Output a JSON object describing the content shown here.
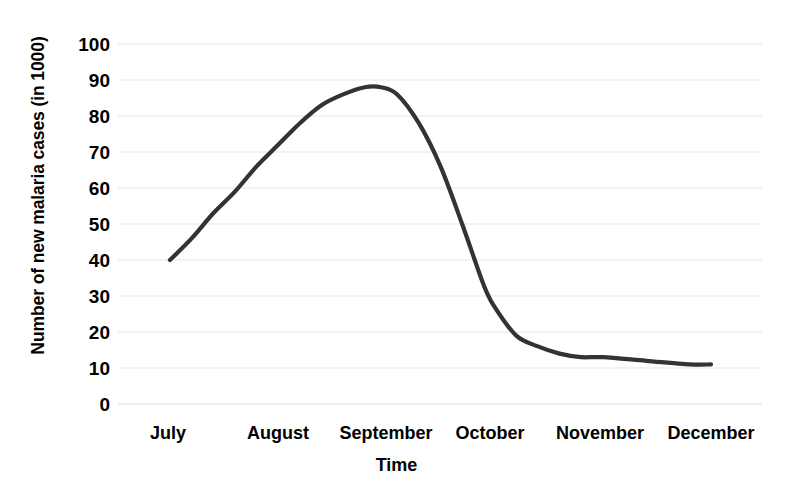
{
  "chart_data": {
    "type": "line",
    "title": "",
    "subtitle": "",
    "xlabel": "Time",
    "ylabel": "Number of new malaria cases (in 1000)",
    "categories": [
      "July",
      "August",
      "September",
      "October",
      "November",
      "December"
    ],
    "xtick_labels": [
      "July",
      "August",
      "September",
      "October",
      "November",
      "December"
    ],
    "ytick_labels": [
      "100",
      "90",
      "80",
      "70",
      "60",
      "50",
      "40",
      "30",
      "20",
      "10",
      "0"
    ],
    "ytick_values": [
      100,
      90,
      80,
      70,
      60,
      50,
      40,
      30,
      20,
      10,
      0
    ],
    "ylim": [
      0,
      100
    ],
    "grid": "horizontal",
    "legend": "none",
    "series": [
      {
        "name": "New malaria cases",
        "color": "#333333",
        "x": [
          "July",
          "August",
          "September",
          "October",
          "November",
          "December"
        ],
        "values": [
          40,
          72,
          88,
          27,
          13,
          11
        ],
        "dense_points": [
          {
            "x": 0.0,
            "y": 40
          },
          {
            "x": 0.2,
            "y": 46
          },
          {
            "x": 0.4,
            "y": 53
          },
          {
            "x": 0.6,
            "y": 59
          },
          {
            "x": 0.8,
            "y": 66
          },
          {
            "x": 1.0,
            "y": 72
          },
          {
            "x": 1.2,
            "y": 78
          },
          {
            "x": 1.4,
            "y": 83
          },
          {
            "x": 1.6,
            "y": 86
          },
          {
            "x": 1.8,
            "y": 88
          },
          {
            "x": 1.95,
            "y": 88
          },
          {
            "x": 2.1,
            "y": 86
          },
          {
            "x": 2.3,
            "y": 78
          },
          {
            "x": 2.5,
            "y": 66
          },
          {
            "x": 2.7,
            "y": 50
          },
          {
            "x": 2.9,
            "y": 33
          },
          {
            "x": 3.0,
            "y": 27
          },
          {
            "x": 3.2,
            "y": 19
          },
          {
            "x": 3.4,
            "y": 16
          },
          {
            "x": 3.6,
            "y": 14
          },
          {
            "x": 3.8,
            "y": 13
          },
          {
            "x": 4.0,
            "y": 13
          },
          {
            "x": 4.4,
            "y": 12
          },
          {
            "x": 4.8,
            "y": 11
          },
          {
            "x": 5.0,
            "y": 11
          }
        ]
      }
    ]
  },
  "axes": {
    "y_axis_title": "Number of new malaria cases (in 1000)",
    "x_axis_title": "Time",
    "grid_color": "#e8e8e8",
    "line_color": "#333333"
  }
}
